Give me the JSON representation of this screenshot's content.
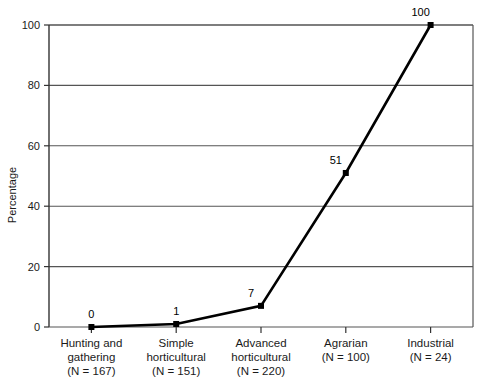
{
  "chart_data": {
    "type": "line",
    "title": "",
    "xlabel": "",
    "ylabel": "Percentage",
    "ylim": [
      0,
      100
    ],
    "yticks": [
      0,
      20,
      40,
      60,
      80,
      100
    ],
    "grid": true,
    "legend": false,
    "categories": [
      "Hunting and gathering",
      "Simple horticultural",
      "Advanced horticultural",
      "Agrarian",
      "Industrial"
    ],
    "category_lines": [
      [
        "Hunting and",
        "gathering",
        "(N = 167)"
      ],
      [
        "Simple",
        "horticultural",
        "(N = 151)"
      ],
      [
        "Advanced",
        "horticultural",
        "(N = 220)"
      ],
      [
        "Agrarian",
        "(N = 100)"
      ],
      [
        "Industrial",
        "(N = 24)"
      ]
    ],
    "sample_sizes": [
      167,
      151,
      220,
      100,
      24
    ],
    "values": [
      0,
      1,
      7,
      51,
      100
    ],
    "point_labels": [
      "0",
      "1",
      "7",
      "51",
      "100"
    ],
    "colors": {
      "line": "#000000",
      "marker": "#000000",
      "grid": "#555555",
      "axis": "#333333",
      "background": "#ffffff",
      "text": "#1a1a1a"
    }
  },
  "axis": {
    "y_title": "Percentage",
    "y_tick_labels": [
      "0",
      "20",
      "40",
      "60",
      "80",
      "100"
    ]
  }
}
